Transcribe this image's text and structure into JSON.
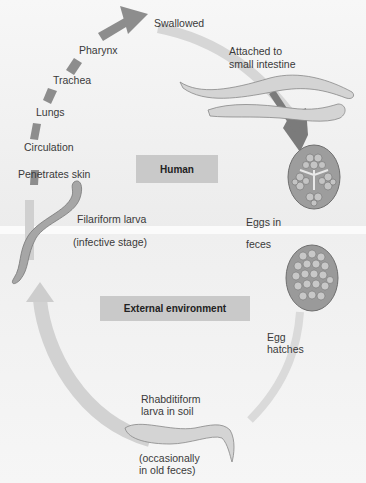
{
  "diagram": {
    "colors": {
      "arrow": "#8d8d8d",
      "arrow_light": "#d8d8d8",
      "box": "#c9c9c9",
      "text": "#3a3a3a"
    },
    "zones": {
      "human": "Human",
      "external": "External environment"
    },
    "stages": {
      "swallowed": "Swallowed",
      "pharynx": "Pharynx",
      "trachea": "Trachea",
      "lungs": "Lungs",
      "circulation": "Circulation",
      "penetrates_skin": "Penetrates skin",
      "attached_1": "Attached to",
      "attached_2": "small intestine",
      "filariform": "Filariform larva",
      "infective": "(infective stage)",
      "eggs_in": "Eggs in",
      "feces": "feces",
      "egg": "Egg",
      "hatches": "hatches",
      "rhabditiform_1": "Rhabditiform",
      "rhabditiform_2": "larva in soil",
      "occasionally_1": "(occasionally",
      "occasionally_2": "in old feces)"
    }
  }
}
